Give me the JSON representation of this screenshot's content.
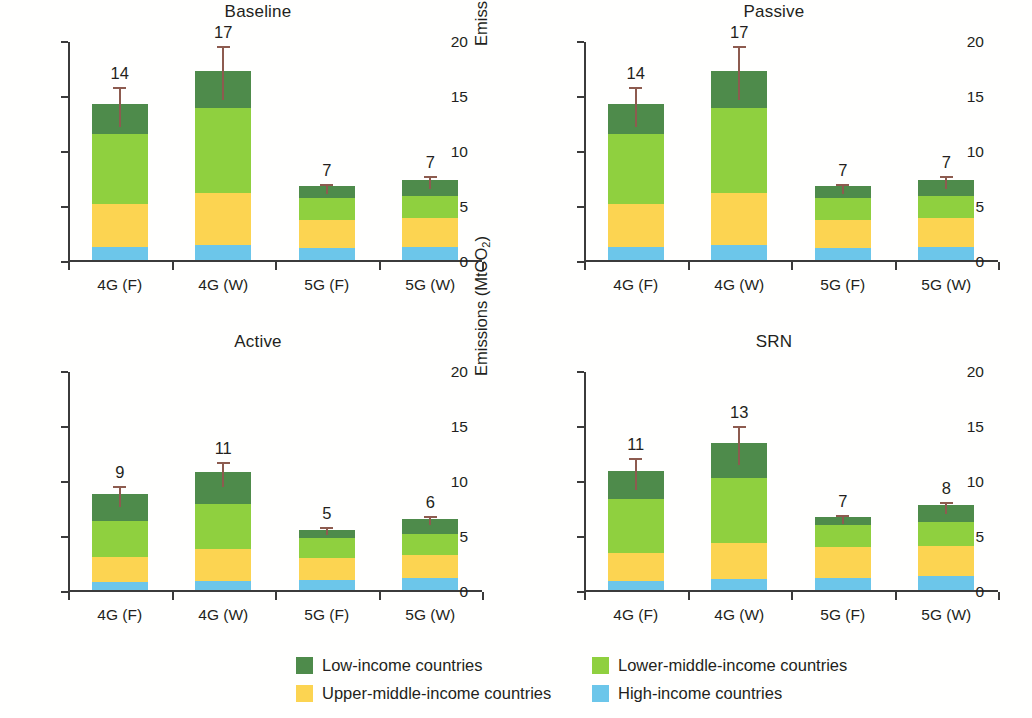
{
  "axis": {
    "ylabel_main": "Emissions (MtCO",
    "ylabel_sub": "2",
    "ylabel_close": ")",
    "yticks": [
      "0",
      "5",
      "10",
      "15",
      "20"
    ],
    "categories": [
      "4G (F)",
      "4G (W)",
      "5G (F)",
      "5G (W)"
    ]
  },
  "legend": {
    "items": [
      {
        "label": "Low-income countries",
        "color": "#4e8b4b",
        "key": "low"
      },
      {
        "label": "Lower-middle-income countries",
        "color": "#8fd03f",
        "key": "lowermid"
      },
      {
        "label": "Upper-middle-income countries",
        "color": "#fcd451",
        "key": "uppermid"
      },
      {
        "label": "High-income countries",
        "color": "#6cc6ea",
        "key": "high"
      }
    ]
  },
  "panels": [
    {
      "title": "Baseline"
    },
    {
      "title": "Passive"
    },
    {
      "title": "Active"
    },
    {
      "title": "SRN"
    }
  ],
  "chart_data": [
    {
      "type": "bar",
      "title": "Baseline",
      "xlabel": "",
      "ylabel": "Emissions (MtCO2)",
      "ylim": [
        0,
        20
      ],
      "yticks": [
        0,
        5,
        10,
        15,
        20
      ],
      "grid": false,
      "stacked": true,
      "legend_position": "bottom",
      "categories": [
        "4G (F)",
        "4G (W)",
        "5G (F)",
        "5G (W)"
      ],
      "series": [
        {
          "name": "High-income countries",
          "values": [
            1.2,
            1.35,
            1.1,
            1.15
          ]
        },
        {
          "name": "Upper-middle-income countries",
          "values": [
            3.9,
            4.75,
            2.5,
            2.65
          ]
        },
        {
          "name": "Lower-middle-income countries",
          "values": [
            6.4,
            7.7,
            2.0,
            2.05
          ]
        },
        {
          "name": "Low-income countries",
          "values": [
            2.7,
            3.4,
            1.1,
            1.45
          ]
        }
      ],
      "totals": [
        14.2,
        17.2,
        6.7,
        7.3
      ],
      "data_labels": [
        "14",
        "17",
        "7",
        "7"
      ],
      "error_bars": [
        {
          "low": 12.3,
          "high": 15.9
        },
        {
          "low": 14.7,
          "high": 19.6
        },
        {
          "low": 6.2,
          "high": 7.1
        },
        {
          "low": 6.6,
          "high": 7.8
        }
      ]
    },
    {
      "type": "bar",
      "title": "Passive",
      "xlabel": "",
      "ylabel": "Emissions (MtCO2)",
      "ylim": [
        0,
        20
      ],
      "yticks": [
        0,
        5,
        10,
        15,
        20
      ],
      "grid": false,
      "stacked": true,
      "legend_position": "bottom",
      "categories": [
        "4G (F)",
        "4G (W)",
        "5G (F)",
        "5G (W)"
      ],
      "series": [
        {
          "name": "High-income countries",
          "values": [
            1.2,
            1.35,
            1.1,
            1.15
          ]
        },
        {
          "name": "Upper-middle-income countries",
          "values": [
            3.9,
            4.75,
            2.5,
            2.65
          ]
        },
        {
          "name": "Lower-middle-income countries",
          "values": [
            6.4,
            7.7,
            2.0,
            2.05
          ]
        },
        {
          "name": "Low-income countries",
          "values": [
            2.7,
            3.4,
            1.1,
            1.45
          ]
        }
      ],
      "totals": [
        14.2,
        17.2,
        6.7,
        7.3
      ],
      "data_labels": [
        "14",
        "17",
        "7",
        "7"
      ],
      "error_bars": [
        {
          "low": 12.3,
          "high": 15.9
        },
        {
          "low": 14.7,
          "high": 19.6
        },
        {
          "low": 6.2,
          "high": 7.1
        },
        {
          "low": 6.6,
          "high": 7.8
        }
      ]
    },
    {
      "type": "bar",
      "title": "Active",
      "xlabel": "",
      "ylabel": "Emissions (MtCO2)",
      "ylim": [
        0,
        20
      ],
      "yticks": [
        0,
        5,
        10,
        15,
        20
      ],
      "grid": false,
      "stacked": true,
      "legend_position": "bottom",
      "categories": [
        "4G (F)",
        "4G (W)",
        "5G (F)",
        "5G (W)"
      ],
      "series": [
        {
          "name": "High-income countries",
          "values": [
            0.7,
            0.8,
            0.9,
            1.1
          ]
        },
        {
          "name": "Upper-middle-income countries",
          "values": [
            2.3,
            2.9,
            2.0,
            2.1
          ]
        },
        {
          "name": "Lower-middle-income countries",
          "values": [
            3.3,
            4.1,
            1.8,
            1.9
          ]
        },
        {
          "name": "Low-income countries",
          "values": [
            2.4,
            2.9,
            0.8,
            1.4
          ]
        }
      ],
      "totals": [
        8.7,
        10.7,
        5.5,
        6.5
      ],
      "data_labels": [
        "9",
        "11",
        "5",
        "6"
      ],
      "error_bars": [
        {
          "low": 7.7,
          "high": 9.6
        },
        {
          "low": 9.5,
          "high": 11.8
        },
        {
          "low": 5.2,
          "high": 5.9
        },
        {
          "low": 6.1,
          "high": 6.9
        }
      ]
    },
    {
      "type": "bar",
      "title": "SRN",
      "xlabel": "",
      "ylabel": "Emissions (MtCO2)",
      "ylim": [
        0,
        20
      ],
      "yticks": [
        0,
        5,
        10,
        15,
        20
      ],
      "grid": false,
      "stacked": true,
      "legend_position": "bottom",
      "categories": [
        "4G (F)",
        "4G (W)",
        "5G (F)",
        "5G (W)"
      ],
      "series": [
        {
          "name": "High-income countries",
          "values": [
            0.8,
            1.0,
            1.1,
            1.25
          ]
        },
        {
          "name": "Upper-middle-income countries",
          "values": [
            2.6,
            3.3,
            2.8,
            2.75
          ]
        },
        {
          "name": "Lower-middle-income countries",
          "values": [
            4.9,
            5.9,
            2.0,
            2.2
          ]
        },
        {
          "name": "Low-income countries",
          "values": [
            2.5,
            3.2,
            0.7,
            1.5
          ]
        }
      ],
      "totals": [
        10.8,
        13.4,
        6.6,
        7.7
      ],
      "data_labels": [
        "11",
        "13",
        "7",
        "8"
      ],
      "error_bars": [
        {
          "low": 9.3,
          "high": 12.2
        },
        {
          "low": 11.5,
          "high": 15.1
        },
        {
          "low": 6.2,
          "high": 7.0
        },
        {
          "low": 7.1,
          "high": 8.2
        }
      ]
    }
  ]
}
